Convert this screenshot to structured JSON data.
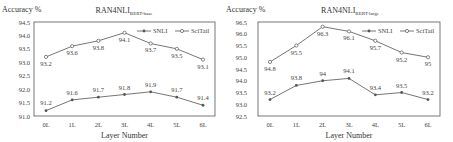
{
  "chart_data": [
    {
      "type": "line",
      "title": "RAN4NLI",
      "title_subscript": "BERT-base",
      "xlabel": "Layer Number",
      "ylabel": "Accuracy %",
      "categories": [
        "0L",
        "1L",
        "2L",
        "3L",
        "4L",
        "5L",
        "6L"
      ],
      "ylim": [
        91.0,
        94.5
      ],
      "yticks": [
        "91.0",
        "91.5",
        "92.0",
        "92.5",
        "93.0",
        "93.5",
        "94.0",
        "94.5"
      ],
      "grid": false,
      "legend_position": "upper right",
      "series": [
        {
          "name": "SNLI",
          "marker": "filled",
          "values": [
            91.2,
            91.6,
            91.7,
            91.8,
            91.9,
            91.7,
            91.4
          ],
          "labels": [
            "91.2",
            "91.6",
            "91.7",
            "91.8",
            "91.9",
            "91.7",
            "91.4"
          ]
        },
        {
          "name": "SciTail",
          "marker": "hollow",
          "values": [
            93.2,
            93.6,
            93.8,
            94.1,
            93.7,
            93.5,
            93.1
          ],
          "labels": [
            "93.2",
            "93.6",
            "93.8",
            "94.1",
            "93.7",
            "93.5",
            "93.1"
          ]
        }
      ]
    },
    {
      "type": "line",
      "title": "RAN4NLI",
      "title_subscript": "BERT-large",
      "xlabel": "Layer Number",
      "ylabel": "Accuracy %",
      "categories": [
        "0L",
        "1L",
        "2L",
        "3L",
        "4L",
        "5L",
        "6L"
      ],
      "ylim": [
        92.5,
        96.5
      ],
      "yticks": [
        "92.5",
        "93.0",
        "93.5",
        "94.0",
        "94.5",
        "95.0",
        "95.5",
        "96.0",
        "96.5"
      ],
      "grid": false,
      "legend_position": "upper right",
      "series": [
        {
          "name": "SNLI",
          "marker": "filled",
          "values": [
            93.2,
            93.8,
            94.0,
            94.1,
            93.4,
            93.5,
            93.2
          ],
          "labels": [
            "93.2",
            "93.8",
            "94",
            "94.1",
            "93.4",
            "93.5",
            "93.2"
          ]
        },
        {
          "name": "SciTail",
          "marker": "hollow",
          "values": [
            94.8,
            95.5,
            96.3,
            96.1,
            95.7,
            95.2,
            95.0
          ],
          "labels": [
            "94.8",
            "95.5",
            "96.3",
            "96.1",
            "95.7",
            "95.2",
            "95"
          ]
        }
      ]
    }
  ]
}
